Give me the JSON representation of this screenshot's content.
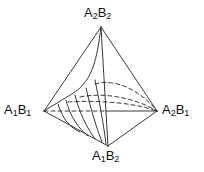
{
  "diagram": {
    "type": "tetrahedron",
    "vertices": {
      "top": {
        "label_a": "A",
        "sub_a": "2",
        "label_b": "B",
        "sub_b": "2",
        "full": "A2B2"
      },
      "left": {
        "label_a": "A",
        "sub_a": "1",
        "label_b": "B",
        "sub_b": "1",
        "full": "A1B1"
      },
      "right": {
        "label_a": "A",
        "sub_a": "2",
        "label_b": "B",
        "sub_b": "1",
        "full": "A2B1"
      },
      "bottom": {
        "label_a": "A",
        "sub_a": "1",
        "label_b": "B",
        "sub_b": "2",
        "full": "A1B2"
      }
    },
    "colors": {
      "line": "#222222",
      "background": "#ffffff"
    }
  }
}
